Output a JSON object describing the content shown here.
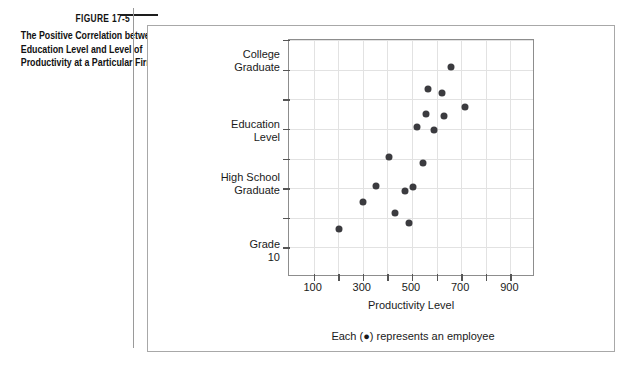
{
  "figure": {
    "number_label": "FIGURE 17-5",
    "caption_lines": [
      "The Positive Correlation between",
      "Education Level and Level of",
      "Productivity at a Particular Firm"
    ],
    "legend_note": "Each (●) represents an employee"
  },
  "chart_data": {
    "type": "scatter",
    "title": "",
    "xlabel": "Productivity  Level",
    "ylabel": "Education\nLevel",
    "xlim": [
      0,
      1000
    ],
    "ylim": [
      0,
      8
    ],
    "grid": true,
    "legend_position": "below-axis",
    "xticks": [
      100,
      200,
      300,
      400,
      500,
      600,
      700,
      800,
      900
    ],
    "xtick_labels": [
      "100",
      "300",
      "500",
      "700",
      "900"
    ],
    "xtick_label_values": [
      100,
      300,
      500,
      700,
      900
    ],
    "ytick_values": [
      1,
      2,
      3,
      4,
      5,
      6,
      7,
      8
    ],
    "ytick_labels": [
      {
        "value": 7,
        "label": "College\nGraduate"
      },
      {
        "value": 3,
        "label": "High School\nGraduate"
      },
      {
        "value": 1,
        "label": "Grade\n10"
      }
    ],
    "point_color": "#3b3b3f",
    "points": [
      {
        "x": 205,
        "y": 1.62
      },
      {
        "x": 300,
        "y": 2.52
      },
      {
        "x": 352,
        "y": 3.07
      },
      {
        "x": 405,
        "y": 4.05
      },
      {
        "x": 430,
        "y": 2.15
      },
      {
        "x": 470,
        "y": 2.9
      },
      {
        "x": 487,
        "y": 1.82
      },
      {
        "x": 505,
        "y": 3.05
      },
      {
        "x": 520,
        "y": 5.05
      },
      {
        "x": 545,
        "y": 3.85
      },
      {
        "x": 555,
        "y": 5.5
      },
      {
        "x": 565,
        "y": 6.35
      },
      {
        "x": 590,
        "y": 4.95
      },
      {
        "x": 620,
        "y": 6.2
      },
      {
        "x": 630,
        "y": 5.42
      },
      {
        "x": 660,
        "y": 7.1
      },
      {
        "x": 715,
        "y": 5.75
      }
    ]
  }
}
